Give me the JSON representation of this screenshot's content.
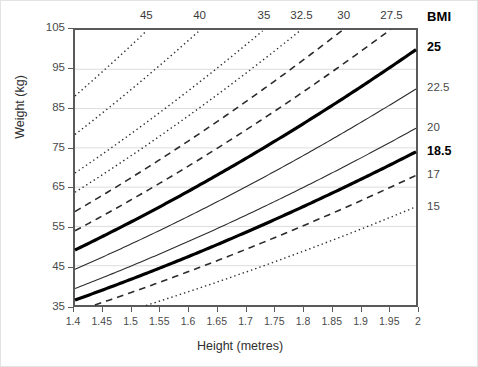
{
  "figure": {
    "bmi_header": "BMI",
    "x_axis_title": "Height (metres)",
    "y_axis_title": "Weight (kg)"
  },
  "chart_data": {
    "type": "line",
    "title": "",
    "subtitle": "",
    "xlabel": "Height (metres)",
    "ylabel": "Weight (kg)",
    "xlim": [
      1.4,
      2.0
    ],
    "ylim": [
      35,
      105
    ],
    "xticks": [
      "1.4",
      "1.45",
      "1.5",
      "1.55",
      "1.6",
      "1.65",
      "1.7",
      "1.75",
      "1.8",
      "1.85",
      "1.9",
      "1.95",
      "2"
    ],
    "xtick_values": [
      1.4,
      1.45,
      1.5,
      1.55,
      1.6,
      1.65,
      1.7,
      1.75,
      1.8,
      1.85,
      1.9,
      1.95,
      2.0
    ],
    "yticks": [
      "35",
      "45",
      "55",
      "65",
      "75",
      "85",
      "95",
      "105"
    ],
    "ytick_values": [
      35,
      45,
      55,
      65,
      75,
      85,
      95,
      105
    ],
    "grid": "horizontal-only",
    "legend_position": "axis-edge-labels",
    "relation": "weight = BMI * height^2",
    "top_labels": [
      "45",
      "40",
      "35",
      "32.5",
      "30",
      "27.5"
    ],
    "right_labels": [
      "25",
      "22.5",
      "20",
      "18.5",
      "17",
      "15"
    ],
    "series": [
      {
        "name": "45",
        "bmi": 45,
        "style": "dotted",
        "width": 1.4,
        "emphasis": "normal",
        "label_side": "top",
        "x_at_top": 1.527,
        "values_at_x": [
          88.2,
          94.5,
          101.3
        ]
      },
      {
        "name": "40",
        "bmi": 40,
        "style": "dotted",
        "width": 1.4,
        "emphasis": "normal",
        "label_side": "top",
        "x_at_top": 1.62,
        "values_at_x": [
          78.4,
          84.1,
          90.0
        ]
      },
      {
        "name": "35",
        "bmi": 35,
        "style": "dotted",
        "width": 1.4,
        "emphasis": "normal",
        "label_side": "top",
        "x_at_top": 1.732,
        "values_at_x": [
          68.6,
          73.6,
          78.8
        ]
      },
      {
        "name": "32.5",
        "bmi": 32.5,
        "style": "dotted",
        "width": 1.4,
        "emphasis": "normal",
        "label_side": "top",
        "x_at_top": 1.798,
        "values_at_x": [
          63.7,
          68.3,
          73.1
        ]
      },
      {
        "name": "30",
        "bmi": 30,
        "style": "dashed",
        "width": 1.6,
        "emphasis": "normal",
        "label_side": "top",
        "x_at_top": 1.871,
        "values_at_x": [
          58.8,
          63.1,
          67.5
        ]
      },
      {
        "name": "27.5",
        "bmi": 27.5,
        "style": "dashed",
        "width": 1.6,
        "emphasis": "normal",
        "label_side": "top",
        "x_at_top": 1.954,
        "values_at_x": [
          53.9,
          57.8,
          61.9
        ]
      },
      {
        "name": "25",
        "bmi": 25,
        "style": "solid",
        "width": 3.2,
        "emphasis": "bold",
        "label_side": "right",
        "y_at_right": 100.0,
        "values_at_x": [
          49.0,
          52.6,
          56.3
        ]
      },
      {
        "name": "22.5",
        "bmi": 22.5,
        "style": "solid",
        "width": 1.1,
        "emphasis": "normal",
        "label_side": "right",
        "y_at_right": 90.0,
        "values_at_x": [
          44.1,
          47.3,
          50.6
        ]
      },
      {
        "name": "20",
        "bmi": 20,
        "style": "solid",
        "width": 1.1,
        "emphasis": "normal",
        "label_side": "right",
        "y_at_right": 80.0,
        "values_at_x": [
          39.2,
          42.0,
          45.0
        ]
      },
      {
        "name": "18.5",
        "bmi": 18.5,
        "style": "solid",
        "width": 3.2,
        "emphasis": "bold",
        "label_side": "right",
        "y_at_right": 74.0,
        "values_at_x": [
          36.3,
          38.9,
          41.6
        ]
      },
      {
        "name": "17",
        "bmi": 17,
        "style": "dashed",
        "width": 1.6,
        "emphasis": "normal",
        "label_side": "right",
        "y_at_right": 68.0,
        "values_at_x": [
          33.3,
          35.7,
          38.3
        ]
      },
      {
        "name": "15",
        "bmi": 15,
        "style": "dotted",
        "width": 1.4,
        "emphasis": "normal",
        "label_side": "right",
        "y_at_right": 60.0,
        "values_at_x": [
          29.4,
          31.5,
          33.8
        ]
      }
    ],
    "sample_x": [
      1.4,
      1.45,
      1.5
    ]
  }
}
